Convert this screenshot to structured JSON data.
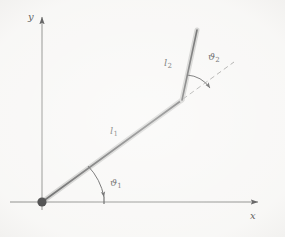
{
  "figure": {
    "background_color": "#f6f5f3",
    "axis_color": "#9a9a97",
    "link_color": "#3a3a3a",
    "link_highlight_color": "#b9b9b6",
    "dash_color": "#8e8e8b",
    "arc_color": "#2b2b2b",
    "marker_color": "#111111",
    "axes": {
      "x_label": "x",
      "y_label": "y",
      "origin_label": ""
    },
    "links": [
      {
        "name": "link-1",
        "label": "l",
        "subscript": "1",
        "from": [
          42,
          202
        ],
        "to": [
          182,
          100
        ]
      },
      {
        "name": "link-2",
        "label": "l",
        "subscript": "2",
        "from": [
          182,
          100
        ],
        "to": [
          197,
          30
        ]
      }
    ],
    "angles": [
      {
        "name": "joint-angle-1",
        "label": "ϑ",
        "subscript": "1",
        "measured_from": "x-axis",
        "measured_to": "link-1"
      },
      {
        "name": "joint-angle-2",
        "label": "ϑ",
        "subscript": "2",
        "measured_from": "link-1-extension",
        "measured_to": "link-2"
      }
    ],
    "extension_line": {
      "name": "link-1-extension",
      "style": "dashed",
      "from": [
        182,
        100
      ],
      "to": [
        234,
        72
      ]
    },
    "base_joint": {
      "name": "base-pivot",
      "position": [
        42,
        202
      ],
      "style": "filled-circle"
    }
  }
}
